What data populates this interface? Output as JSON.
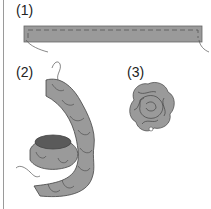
{
  "figure": {
    "steps": [
      {
        "label": "(1)",
        "description": "flat fabric strip with running stitch"
      },
      {
        "label": "(2)",
        "description": "gathered strip coiled into a spiral"
      },
      {
        "label": "(3)",
        "description": "finished fabric rosette"
      }
    ],
    "colors": {
      "fabric": "#9a9a9a",
      "outline": "#555555",
      "inner": "#5a5a5a",
      "stitch": "#666666"
    }
  }
}
